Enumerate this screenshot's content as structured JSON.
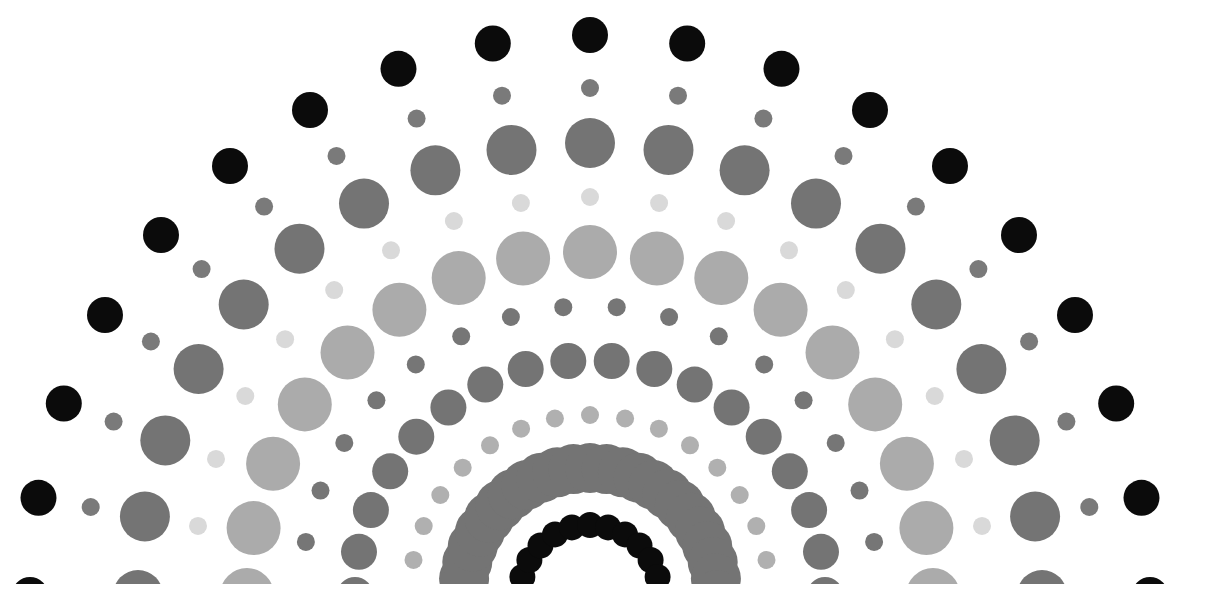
{
  "artwork": {
    "title": "Concentric semicircular dot rings",
    "center": {
      "x": 590,
      "y": 595
    },
    "background": "#ffffff",
    "rings": [
      {
        "name": "outer-black-ring",
        "radius": 560,
        "dot_radius": 18,
        "step_deg": 10,
        "color": "#0b0b0b"
      },
      {
        "name": "small-gray-ring",
        "radius": 507,
        "dot_radius": 9,
        "step_deg": 10,
        "color": "#7a7a7a"
      },
      {
        "name": "large-dark-gray-ring",
        "radius": 452,
        "dot_radius": 25,
        "step_deg": 10,
        "color": "#747474"
      },
      {
        "name": "small-pale-ring",
        "radius": 398,
        "dot_radius": 9,
        "step_deg": 10,
        "color": "#d9d9d9"
      },
      {
        "name": "large-light-gray-ring",
        "radius": 343,
        "dot_radius": 27,
        "step_deg": 11.25,
        "color": "#ababab"
      },
      {
        "name": "small-dark-gray-ring",
        "radius": 289,
        "dot_radius": 9,
        "step_deg": 10.59,
        "color": "#767676"
      },
      {
        "name": "medium-dark-gray-ring",
        "radius": 235,
        "dot_radius": 18,
        "step_deg": 10.59,
        "color": "#747474"
      },
      {
        "name": "small-mid-gray-ring",
        "radius": 180,
        "dot_radius": 9,
        "step_deg": 11.25,
        "color": "#b0b0b0"
      },
      {
        "name": "overlapping-gray-ring",
        "radius": 127,
        "dot_radius": 25,
        "step_deg": 7.5,
        "color": "#747474"
      },
      {
        "name": "inner-black-ring",
        "radius": 70,
        "dot_radius": 13,
        "step_deg": 15,
        "color": "#0b0b0b"
      }
    ]
  }
}
